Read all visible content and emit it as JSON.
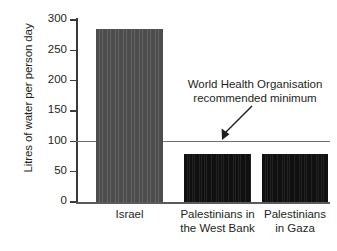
{
  "chart_data": {
    "type": "bar",
    "title": "",
    "xlabel": "",
    "ylabel": "Litres of water per person day",
    "categories": [
      "Israel",
      "Palestinians in the West Bank",
      "Palestinians in Gaza"
    ],
    "category_lines": [
      [
        "Israel"
      ],
      [
        "Palestinians in",
        "the West Bank"
      ],
      [
        "Palestinians",
        "in Gaza"
      ]
    ],
    "values": [
      285,
      79,
      79
    ],
    "bar_colors": [
      "#525252",
      "#151515",
      "#151515"
    ],
    "ylim": [
      0,
      300
    ],
    "yticks": [
      0,
      50,
      100,
      150,
      200,
      250,
      300
    ],
    "ytick_labels": [
      "0",
      "50",
      "100",
      "150",
      "200",
      "250",
      "300"
    ],
    "grid": false,
    "legend": "none",
    "reference_lines": [
      {
        "value": 100,
        "color": "#6e6e6e",
        "label_lines": [
          "World Health Organisation",
          "recommended minimum"
        ]
      }
    ],
    "annotations": [
      {
        "name": "who-minimum-annotation",
        "text_lines": [
          "World Health Organisation",
          "recommended minimum"
        ],
        "arrow": "down-left-to-100-line"
      }
    ]
  },
  "axis": {
    "y_title": "Litres of water per person day"
  },
  "annotation": {
    "line1": "World Health Organisation",
    "line2": "recommended minimum"
  }
}
